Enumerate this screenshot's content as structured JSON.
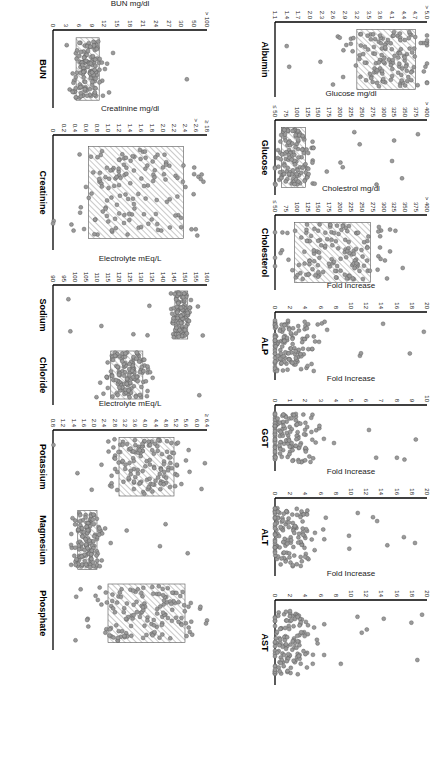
{
  "figure": {
    "orientation": "rotated 90 degrees clockwise",
    "hatch_color": "#777777",
    "dot_fill": "#9a9a9a",
    "dot_stroke": "#555555",
    "axis_color": "#000000"
  },
  "chart_data": [
    {
      "type": "scatter",
      "subtype": "dot-plot",
      "title": "Albumin",
      "ylabel": "Albumin gm/dl",
      "yticks": [
        "> 5.0",
        "4.7",
        "4.4",
        "4.1",
        "3.8",
        "3.5",
        "3.2",
        "2.9",
        "2.6",
        "2.3",
        "2.0",
        "1.7",
        "1.4",
        "1.1"
      ],
      "ylim": [
        1.1,
        5.0
      ],
      "reference_range": [
        3.2,
        4.7
      ],
      "row": 1,
      "col": 1
    },
    {
      "type": "scatter",
      "subtype": "dot-plot",
      "title": "Glucose",
      "ylabel": "Glucose mg/dl",
      "yticks": [
        "> 400",
        "375",
        "350",
        "325",
        "300",
        "275",
        "250",
        "225",
        "200",
        "175",
        "150",
        "125",
        "100",
        "75",
        "≤ 50"
      ],
      "ylim": [
        50,
        400
      ],
      "reference_range": [
        65,
        120
      ],
      "row": 1,
      "col": 2
    },
    {
      "type": "scatter",
      "subtype": "dot-plot",
      "title": "Cholesterol",
      "ylabel": "Cholestrol mg/dl",
      "yticks": [
        "> 400",
        "375",
        "350",
        "325",
        "300",
        "275",
        "250",
        "225",
        "200",
        "175",
        "150",
        "125",
        "100",
        "75",
        "≤ 50"
      ],
      "ylim": [
        50,
        400
      ],
      "reference_range": [
        95,
        270
      ],
      "row": 1,
      "col": 3
    },
    {
      "type": "scatter",
      "subtype": "dot-plot",
      "title": "ALP",
      "ylabel": "Fold Increase",
      "yticks": [
        "20",
        "18",
        "16",
        "14",
        "12",
        "10",
        "8",
        "6",
        "4",
        "2",
        "0"
      ],
      "ylim": [
        0,
        20
      ],
      "row": 1,
      "col": 4
    },
    {
      "type": "scatter",
      "subtype": "dot-plot",
      "title": "GGT",
      "ylabel": "Fold Increase",
      "yticks": [
        "10",
        "9",
        "8",
        "7",
        "6",
        "5",
        "4",
        "3",
        "2",
        "1",
        "0"
      ],
      "ylim": [
        0,
        10
      ],
      "row": 1,
      "col": 5
    },
    {
      "type": "scatter",
      "subtype": "dot-plot",
      "title": "ALT",
      "ylabel": "Fold Increase",
      "yticks": [
        "20",
        "18",
        "16",
        "14",
        "12",
        "10",
        "8",
        "6",
        "4",
        "2",
        "0"
      ],
      "ylim": [
        0,
        20
      ],
      "row": 1,
      "col": 6
    },
    {
      "type": "scatter",
      "subtype": "dot-plot",
      "title": "AST",
      "ylabel": "Fold Increase",
      "yticks": [
        "20",
        "18",
        "16",
        "14",
        "12",
        "10",
        "8",
        "6",
        "4",
        "2",
        "0"
      ],
      "ylim": [
        0,
        20
      ],
      "row": 1,
      "col": 7
    },
    {
      "type": "scatter",
      "subtype": "dot-plot",
      "title": "BUN",
      "ylabel": "BUN mg/dl",
      "yticks": [
        "> 100",
        "50",
        "30",
        "27",
        "24",
        "21",
        "18",
        "15",
        "12",
        "9",
        "6",
        "3",
        "0"
      ],
      "ylim": [
        0,
        100
      ],
      "reference_range": [
        15,
        30
      ],
      "row": 2,
      "col": 1
    },
    {
      "type": "scatter",
      "subtype": "dot-plot",
      "title": "Creatinine",
      "ylabel": "Creatinine mg/dl",
      "yticks": [
        "≥ 18",
        "> 2.6",
        "2.4",
        "2.2",
        "2.0",
        "1.8",
        "1.6",
        "1.4",
        "1.2",
        "1.0",
        "0.8",
        "0.6",
        "0.4",
        "0.2",
        "0"
      ],
      "ylim": [
        0,
        2.6
      ],
      "reference_range": [
        0.6,
        2.2
      ],
      "row": 2,
      "col": 2
    },
    {
      "type": "scatter",
      "subtype": "dot-plot",
      "title": "Sodium / Chloride",
      "categories": [
        "Sodium",
        "Chloride"
      ],
      "ylabel": "Electrolyte mEq/L",
      "yticks": [
        "160",
        "155",
        "150",
        "145",
        "140",
        "135",
        "130",
        "125",
        "120",
        "115",
        "110",
        "105",
        "100",
        "95",
        "90"
      ],
      "ylim": [
        88,
        160
      ],
      "reference_ranges": {
        "Sodium": [
          145,
          151
        ],
        "Chloride": [
          115,
          130
        ]
      },
      "row": 2,
      "col": 3
    },
    {
      "type": "scatter",
      "subtype": "dot-plot",
      "title": "Potassium / Magnesium / Phosphate",
      "categories": [
        "Potassium",
        "Magnesium",
        "Phosphate"
      ],
      "ylabel": "Electrolyte mEq/L",
      "yticks": [
        "≥ 6.4",
        "6.0",
        "5.6",
        "5.2",
        "4.8",
        "4.4",
        "4.0",
        "3.6",
        "3.2",
        "2.8",
        "2.4",
        "2.0",
        "1.6",
        "1.4",
        "1.2",
        "0.8"
      ],
      "ylim": [
        0.8,
        6.4
      ],
      "reference_ranges": {
        "Potassium": [
          3.2,
          5.2
        ],
        "Magnesium": [
          1.7,
          2.4
        ],
        "Phosphate": [
          2.8,
          5.6
        ]
      },
      "row": 2,
      "col": 4
    }
  ]
}
